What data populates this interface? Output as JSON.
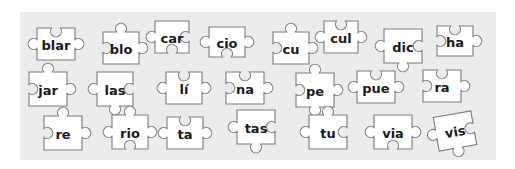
{
  "panel": {
    "background": "#ececec",
    "piece_fill": "#ffffff",
    "piece_stroke": "#7a7a7a",
    "text_color": "#1a1a1a"
  },
  "pieces": [
    {
      "label": "blar",
      "cx": 56,
      "cy": 44,
      "w": 38,
      "h": 32,
      "top": "blank",
      "right": "tab",
      "bottom": "flat",
      "left": "tab",
      "rot": 0
    },
    {
      "label": "blo",
      "cx": 121,
      "cy": 48,
      "w": 36,
      "h": 32,
      "top": "tab",
      "right": "tab",
      "bottom": "flat",
      "left": "blank",
      "rot": 0
    },
    {
      "label": "car",
      "cx": 172,
      "cy": 37,
      "w": 34,
      "h": 32,
      "top": "flat",
      "right": "blank",
      "bottom": "blank",
      "left": "tab",
      "rot": 0
    },
    {
      "label": "cio",
      "cx": 227,
      "cy": 42,
      "w": 36,
      "h": 30,
      "top": "flat",
      "right": "tab",
      "bottom": "blank",
      "left": "tab",
      "rot": 0
    },
    {
      "label": "cu",
      "cx": 291,
      "cy": 48,
      "w": 36,
      "h": 32,
      "top": "tab",
      "right": "tab",
      "bottom": "flat",
      "left": "blank",
      "rot": 0
    },
    {
      "label": "cul",
      "cx": 341,
      "cy": 37,
      "w": 34,
      "h": 32,
      "top": "blank",
      "right": "tab",
      "bottom": "flat",
      "left": "tab",
      "rot": 0
    },
    {
      "label": "dic",
      "cx": 403,
      "cy": 46,
      "w": 38,
      "h": 34,
      "top": "flat",
      "right": "blank",
      "bottom": "tab",
      "left": "tab",
      "rot": 0
    },
    {
      "label": "ha",
      "cx": 455,
      "cy": 41,
      "w": 36,
      "h": 30,
      "top": "blank",
      "right": "tab",
      "bottom": "flat",
      "left": "blank",
      "rot": 0
    },
    {
      "label": "jar",
      "cx": 48,
      "cy": 89,
      "w": 38,
      "h": 34,
      "top": "tab",
      "right": "tab",
      "bottom": "flat",
      "left": "blank",
      "rot": 0
    },
    {
      "label": "las",
      "cx": 115,
      "cy": 89,
      "w": 36,
      "h": 34,
      "top": "flat",
      "right": "blank",
      "bottom": "tab",
      "left": "tab",
      "rot": 0
    },
    {
      "label": "lí",
      "cx": 184,
      "cy": 88,
      "w": 36,
      "h": 32,
      "top": "blank",
      "right": "tab",
      "bottom": "flat",
      "left": "tab",
      "rot": 0
    },
    {
      "label": "na",
      "cx": 245,
      "cy": 88,
      "w": 38,
      "h": 32,
      "top": "blank",
      "right": "tab",
      "bottom": "flat",
      "left": "blank",
      "rot": 0
    },
    {
      "label": "pe",
      "cx": 315,
      "cy": 90,
      "w": 38,
      "h": 34,
      "top": "tab",
      "right": "tab",
      "bottom": "tab",
      "left": "blank",
      "rot": 0
    },
    {
      "label": "pue",
      "cx": 376,
      "cy": 87,
      "w": 38,
      "h": 32,
      "top": "blank",
      "right": "tab",
      "bottom": "flat",
      "left": "tab",
      "rot": 0
    },
    {
      "label": "ra",
      "cx": 442,
      "cy": 86,
      "w": 38,
      "h": 32,
      "top": "blank",
      "right": "tab",
      "bottom": "flat",
      "left": "blank",
      "rot": 0
    },
    {
      "label": "re",
      "cx": 63,
      "cy": 133,
      "w": 38,
      "h": 34,
      "top": "tab",
      "right": "tab",
      "bottom": "flat",
      "left": "blank",
      "rot": 0
    },
    {
      "label": "rio",
      "cx": 130,
      "cy": 132,
      "w": 36,
      "h": 34,
      "top": "tab",
      "right": "tab",
      "bottom": "blank",
      "left": "tab",
      "rot": 0
    },
    {
      "label": "ta",
      "cx": 185,
      "cy": 133,
      "w": 36,
      "h": 32,
      "top": "blank",
      "right": "tab",
      "bottom": "flat",
      "left": "tab",
      "rot": 0
    },
    {
      "label": "tas",
      "cx": 256,
      "cy": 127,
      "w": 38,
      "h": 34,
      "top": "flat",
      "right": "blank",
      "bottom": "tab",
      "left": "tab",
      "rot": 0
    },
    {
      "label": "tu",
      "cx": 328,
      "cy": 132,
      "w": 38,
      "h": 34,
      "top": "tab",
      "right": "blank",
      "bottom": "flat",
      "left": "tab",
      "rot": 0
    },
    {
      "label": "via",
      "cx": 393,
      "cy": 132,
      "w": 38,
      "h": 34,
      "top": "flat",
      "right": "tab",
      "bottom": "blank",
      "left": "tab",
      "rot": 0
    },
    {
      "label": "vis",
      "cx": 455,
      "cy": 131,
      "w": 38,
      "h": 34,
      "top": "flat",
      "right": "blank",
      "bottom": "tab",
      "left": "tab",
      "rot": -10
    }
  ]
}
